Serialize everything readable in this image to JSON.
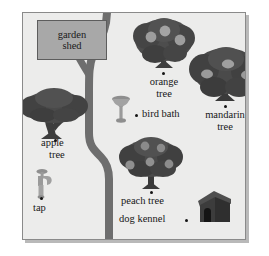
{
  "map": {
    "title": "garden map",
    "background_color": "#ececeb",
    "frame_color": "#8a8a8a",
    "path_color": "#6d6d6d",
    "tree_color": "#4a4a4a",
    "fruit_color": "#9a9a9a"
  },
  "features": [
    {
      "id": "garden-shed",
      "icon": "shed-icon",
      "label": "garden\nshed",
      "label_line1": "garden",
      "label_line2": "shed",
      "label_inside": true,
      "fill": "#a8a8a8",
      "stroke": "#5d5d5d"
    },
    {
      "id": "orange-tree",
      "icon": "tree-icon",
      "label_line1": "orange",
      "label_line2": "tree",
      "fruit_count": 3
    },
    {
      "id": "mandarin-tree",
      "icon": "tree-icon",
      "label_line1": "mandarin",
      "label_line2": "tree",
      "fruit_count": 3
    },
    {
      "id": "apple-tree",
      "icon": "tree-icon",
      "label_line1": "apple",
      "label_line2": "tree",
      "fruit_count": 0
    },
    {
      "id": "bird-bath",
      "icon": "bird-bath-icon",
      "label_line1": "bird bath",
      "label_line2": ""
    },
    {
      "id": "peach-tree",
      "icon": "tree-icon",
      "label_line1": "peach tree",
      "label_line2": "",
      "fruit_count": 5
    },
    {
      "id": "tap",
      "icon": "tap-icon",
      "label_line1": "tap",
      "label_line2": ""
    },
    {
      "id": "dog-kennel",
      "icon": "dog-kennel-icon",
      "label_line1": "dog kennel",
      "label_line2": ""
    }
  ],
  "labels": {
    "garden_shed_line1": "garden",
    "garden_shed_line2": "shed",
    "orange_tree_line1": "orange",
    "orange_tree_line2": "tree",
    "mandarin_tree_line1": "mandarin",
    "mandarin_tree_line2": "tree",
    "apple_tree_line1": "apple",
    "apple_tree_line2": "tree",
    "bird_bath": "bird bath",
    "peach_tree": "peach tree",
    "tap": "tap",
    "dog_kennel": "dog kennel"
  }
}
